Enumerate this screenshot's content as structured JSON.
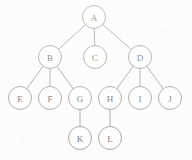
{
  "diagram": {
    "type": "tree",
    "background_color": "#fdfdfc",
    "stroke_color": "#6b6b6b",
    "label_color": "#2b2b2b",
    "node_radius": 11.5,
    "nodes": [
      {
        "id": "A",
        "label": "A",
        "x": 94,
        "y": 17,
        "level": 0
      },
      {
        "id": "B",
        "label": "B",
        "x": 50,
        "y": 57,
        "level": 1
      },
      {
        "id": "C",
        "label": "C",
        "x": 95,
        "y": 57,
        "level": 1
      },
      {
        "id": "D",
        "label": "D",
        "x": 140,
        "y": 57,
        "level": 1
      },
      {
        "id": "E",
        "label": "E",
        "x": 20,
        "y": 98,
        "level": 2
      },
      {
        "id": "F",
        "label": "F",
        "x": 50,
        "y": 98,
        "level": 2
      },
      {
        "id": "G",
        "label": "G",
        "x": 80,
        "y": 98,
        "level": 2
      },
      {
        "id": "H",
        "label": "H",
        "x": 110,
        "y": 98,
        "level": 2
      },
      {
        "id": "I",
        "label": "I",
        "x": 140,
        "y": 98,
        "level": 2
      },
      {
        "id": "J",
        "label": "J",
        "x": 170,
        "y": 98,
        "level": 2
      },
      {
        "id": "K",
        "label": "K",
        "x": 80,
        "y": 138,
        "level": 3
      },
      {
        "id": "L",
        "label": "L",
        "x": 110,
        "y": 138,
        "level": 3
      }
    ],
    "edges": [
      {
        "from": "A",
        "to": "B"
      },
      {
        "from": "A",
        "to": "C"
      },
      {
        "from": "A",
        "to": "D"
      },
      {
        "from": "B",
        "to": "E"
      },
      {
        "from": "B",
        "to": "F"
      },
      {
        "from": "B",
        "to": "G"
      },
      {
        "from": "D",
        "to": "H"
      },
      {
        "from": "D",
        "to": "I"
      },
      {
        "from": "D",
        "to": "J"
      },
      {
        "from": "G",
        "to": "K"
      },
      {
        "from": "H",
        "to": "L"
      }
    ]
  }
}
